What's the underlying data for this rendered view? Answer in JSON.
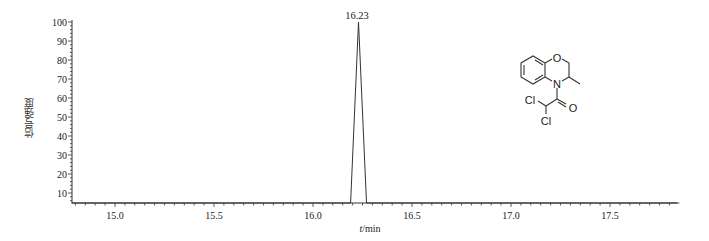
{
  "chart_data": {
    "type": "line",
    "title": "",
    "xlabel": "t/min",
    "ylabel": "信号强度",
    "xlim": [
      14.78,
      17.85
    ],
    "ylim": [
      4,
      101
    ],
    "x_ticks": [
      15.0,
      15.5,
      16.0,
      16.5,
      17.0,
      17.5
    ],
    "x_tick_labels": [
      "15.0",
      "15.5",
      "16.0",
      "16.5",
      "17.0",
      "17.5"
    ],
    "y_ticks": [
      10,
      20,
      30,
      40,
      50,
      60,
      70,
      80,
      90,
      100
    ],
    "y_tick_labels": [
      "10",
      "20",
      "30",
      "40",
      "50",
      "60",
      "70",
      "80",
      "90",
      "100"
    ],
    "grid": false,
    "legend": null,
    "series": [
      {
        "name": "chromatogram",
        "x": [
          14.78,
          16.19,
          16.23,
          16.27,
          17.85
        ],
        "y": [
          4,
          4,
          100,
          4,
          4
        ]
      }
    ],
    "annotations": [
      {
        "text": "16.23",
        "x": 16.23,
        "y": 100,
        "type": "peak-retention-time"
      }
    ],
    "inset": {
      "type": "chemical-structure",
      "description": "4-(dichloroacetyl)-3-methyl-3,4-dihydro-2H-1,4-benzoxazine",
      "atom_labels": [
        "O",
        "N",
        "O",
        "Cl",
        "Cl"
      ]
    }
  },
  "labels": {
    "ylabel": "信号强度",
    "xlabel_italic": "t",
    "xlabel_unit": "/min",
    "peak": "16.23",
    "atom_O_ring": "O",
    "atom_N": "N",
    "atom_O_carbonyl": "O",
    "atom_Cl_1": "Cl",
    "atom_Cl_2": "Cl"
  }
}
